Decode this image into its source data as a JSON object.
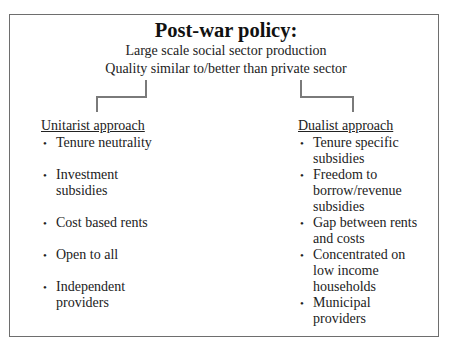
{
  "diagram": {
    "title": "Post-war policy:",
    "subtitle_lines": [
      "Large scale social sector production",
      "Quality similar to/better than private sector"
    ],
    "branches": [
      {
        "heading": "Unitarist approach",
        "items": [
          "Tenure neutrality",
          "Investment subsidies",
          "Cost based rents",
          "Open to all",
          "Independent providers"
        ]
      },
      {
        "heading": "Dualist approach",
        "items": [
          "Tenure specific subsidies",
          "Freedom to borrow/revenue subsidies",
          "Gap between rents and costs",
          "Concentrated on low income households",
          "Municipal providers"
        ]
      }
    ],
    "bullet_glyph": "•",
    "colors": {
      "border": "#6e6e6e",
      "connector": "#7a7a7a",
      "text": "#222222",
      "background": "#ffffff"
    }
  }
}
